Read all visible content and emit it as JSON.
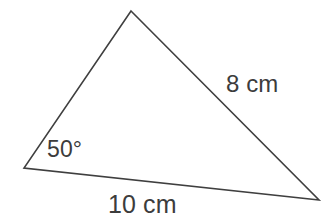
{
  "figure": {
    "type": "triangle-diagram",
    "background_color": "#ffffff",
    "stroke_color": "#3f3f3f",
    "stroke_width": 1.6,
    "text_color": "#3c3c3c",
    "width": 333,
    "height": 223,
    "vertices": {
      "apex": {
        "x": 131,
        "y": 11
      },
      "bottom_left": {
        "x": 24,
        "y": 168
      },
      "bottom_right": {
        "x": 319,
        "y": 200
      }
    },
    "polygon_points": "131,11 319,200 24,168",
    "labels": {
      "side_right": "8 cm",
      "angle_bottom_left": "50°",
      "side_bottom": "10 cm"
    }
  }
}
